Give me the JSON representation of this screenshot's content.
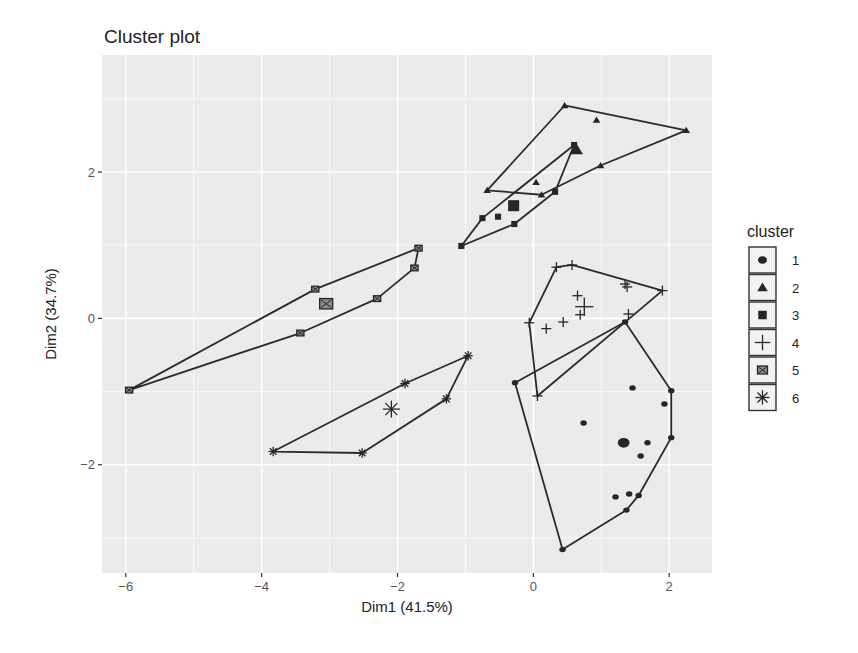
{
  "chart_data": {
    "type": "scatter",
    "title": "Cluster plot",
    "xlabel": "Dim1 (41.5%)",
    "ylabel": "Dim2 (34.7%)",
    "xlim": [
      -6.35,
      2.63
    ],
    "ylim": [
      -3.48,
      3.6
    ],
    "xticks": [
      -6,
      -4,
      -2,
      0,
      2
    ],
    "yticks": [
      -2,
      0,
      2
    ],
    "xtick_labels": [
      "−6",
      "−4",
      "−2",
      "0",
      "2"
    ],
    "ytick_labels": [
      "−2",
      "0",
      "2"
    ],
    "grid": true,
    "legend": {
      "title": "cluster",
      "position": "right",
      "entries": [
        {
          "label": "1",
          "shape": "circle"
        },
        {
          "label": "2",
          "shape": "triangle"
        },
        {
          "label": "3",
          "shape": "square"
        },
        {
          "label": "4",
          "shape": "plus"
        },
        {
          "label": "5",
          "shape": "boxed-x"
        },
        {
          "label": "6",
          "shape": "asterisk"
        }
      ]
    },
    "series": [
      {
        "name": "1",
        "shape": "circle",
        "points": [
          [
            -0.27,
            -0.88
          ],
          [
            0.43,
            -3.16
          ],
          [
            1.37,
            -2.62
          ],
          [
            1.55,
            -2.42
          ],
          [
            2.03,
            -1.63
          ],
          [
            2.03,
            -0.99
          ],
          [
            1.35,
            -0.05
          ],
          [
            1.46,
            -0.95
          ],
          [
            1.93,
            -1.17
          ],
          [
            0.74,
            -1.43
          ],
          [
            1.68,
            -1.7
          ],
          [
            1.58,
            -1.88
          ],
          [
            1.21,
            -2.44
          ],
          [
            1.41,
            -2.4
          ]
        ],
        "hull": [
          [
            -0.27,
            -0.88
          ],
          [
            0.43,
            -3.16
          ],
          [
            1.37,
            -2.62
          ],
          [
            1.55,
            -2.42
          ],
          [
            2.03,
            -1.63
          ],
          [
            2.03,
            -0.99
          ],
          [
            1.35,
            -0.05
          ]
        ],
        "centroid": [
          1.33,
          -1.7
        ]
      },
      {
        "name": "2",
        "shape": "triangle",
        "points": [
          [
            -0.68,
            1.75
          ],
          [
            0.46,
            2.91
          ],
          [
            2.25,
            2.57
          ],
          [
            0.99,
            2.09
          ],
          [
            0.12,
            1.69
          ],
          [
            0.93,
            2.71
          ],
          [
            0.04,
            1.86
          ]
        ],
        "hull": [
          [
            -0.68,
            1.75
          ],
          [
            0.46,
            2.91
          ],
          [
            2.25,
            2.57
          ],
          [
            0.99,
            2.09
          ],
          [
            0.12,
            1.69
          ]
        ],
        "centroid": [
          0.63,
          2.31
        ]
      },
      {
        "name": "3",
        "shape": "square",
        "points": [
          [
            -1.06,
            0.99
          ],
          [
            -0.75,
            1.37
          ],
          [
            -0.52,
            1.39
          ],
          [
            -0.28,
            1.29
          ],
          [
            0.32,
            1.73
          ],
          [
            0.6,
            2.37
          ]
        ],
        "hull": [
          [
            -1.06,
            0.99
          ],
          [
            -0.75,
            1.37
          ],
          [
            0.6,
            2.37
          ],
          [
            0.32,
            1.73
          ],
          [
            -0.28,
            1.29
          ]
        ],
        "centroid": [
          -0.29,
          1.54
        ]
      },
      {
        "name": "4",
        "shape": "plus",
        "points": [
          [
            -0.06,
            -0.06
          ],
          [
            0.34,
            0.7
          ],
          [
            0.57,
            0.73
          ],
          [
            1.9,
            0.38
          ],
          [
            0.06,
            -1.06
          ],
          [
            0.19,
            -0.14
          ],
          [
            0.44,
            -0.05
          ],
          [
            0.69,
            0.05
          ],
          [
            0.65,
            0.31
          ],
          [
            1.38,
            0.43
          ],
          [
            1.35,
            0.47
          ],
          [
            1.4,
            0.06
          ]
        ],
        "hull": [
          [
            -0.06,
            -0.06
          ],
          [
            0.34,
            0.7
          ],
          [
            0.57,
            0.73
          ],
          [
            1.9,
            0.38
          ],
          [
            0.06,
            -1.06
          ]
        ],
        "centroid": [
          0.75,
          0.16
        ]
      },
      {
        "name": "5",
        "shape": "boxed-x",
        "points": [
          [
            -5.95,
            -0.98
          ],
          [
            -3.21,
            0.4
          ],
          [
            -1.69,
            0.96
          ],
          [
            -1.75,
            0.69
          ],
          [
            -2.3,
            0.27
          ],
          [
            -3.43,
            -0.2
          ]
        ],
        "hull": [
          [
            -5.95,
            -0.98
          ],
          [
            -3.21,
            0.4
          ],
          [
            -1.69,
            0.96
          ],
          [
            -1.75,
            0.69
          ],
          [
            -2.3,
            0.27
          ],
          [
            -3.43,
            -0.2
          ]
        ],
        "centroid": [
          -3.05,
          0.2
        ]
      },
      {
        "name": "6",
        "shape": "asterisk",
        "points": [
          [
            -3.83,
            -1.82
          ],
          [
            -2.52,
            -1.84
          ],
          [
            -1.28,
            -1.1
          ],
          [
            -0.96,
            -0.51
          ],
          [
            -1.89,
            -0.89
          ]
        ],
        "hull": [
          [
            -3.83,
            -1.82
          ],
          [
            -2.52,
            -1.84
          ],
          [
            -1.28,
            -1.1
          ],
          [
            -0.96,
            -0.51
          ],
          [
            -1.89,
            -0.89
          ]
        ],
        "centroid": [
          -2.09,
          -1.24
        ]
      }
    ]
  }
}
